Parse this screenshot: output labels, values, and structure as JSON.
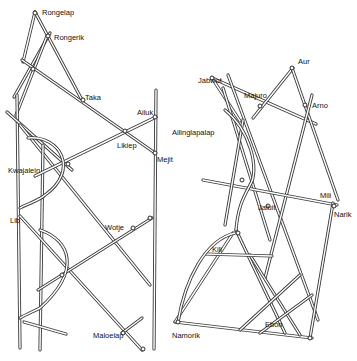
{
  "diagram": {
    "type": "Marshall Islands stick navigation charts",
    "left_chart": {
      "labels": [
        {
          "text": "Rongelap",
          "x": 42,
          "y": 15
        },
        {
          "text": "Rongerik",
          "x": 54,
          "y": 40
        },
        {
          "text": "Taka",
          "x": 85,
          "y": 100
        },
        {
          "text": "Ailuk",
          "x": 137,
          "y": 115
        },
        {
          "text": "Likiep",
          "x": 117,
          "y": 148
        },
        {
          "text": "Mejit",
          "x": 157,
          "y": 162
        },
        {
          "text": "Kwajalein",
          "x": 8,
          "y": 173
        },
        {
          "text": "Lib",
          "x": 10,
          "y": 223
        },
        {
          "text": "Wotje",
          "x": 105,
          "y": 230
        },
        {
          "text": "Maloelap",
          "x": 93,
          "y": 338
        }
      ]
    },
    "right_chart": {
      "labels": [
        {
          "text": "Jabwot",
          "x": 198,
          "y": 83
        },
        {
          "text": "Aur",
          "x": 298,
          "y": 64
        },
        {
          "text": "Majuro",
          "x": 244,
          "y": 98
        },
        {
          "text": "Arno",
          "x": 312,
          "y": 108
        },
        {
          "text": "Ailinglapalap",
          "x": 172,
          "y": 135
        },
        {
          "text": "Mili",
          "x": 320,
          "y": 198
        },
        {
          "text": "Narik",
          "x": 334,
          "y": 217
        },
        {
          "text": "Jaluit",
          "x": 258,
          "y": 210
        },
        {
          "text": "Kili",
          "x": 212,
          "y": 252
        },
        {
          "text": "Namorik",
          "x": 172,
          "y": 338
        },
        {
          "text": "Ebon",
          "x": 265,
          "y": 327
        }
      ]
    }
  }
}
